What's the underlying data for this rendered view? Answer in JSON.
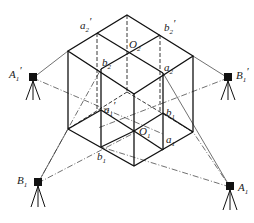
{
  "diagram": {
    "type": "survey-setup",
    "stroke_color": "#1a1a1a",
    "background": "#ffffff",
    "points": {
      "a2p": {
        "name": "a",
        "sub": "2",
        "prime": true
      },
      "b2p": {
        "name": "b",
        "sub": "2",
        "prime": true
      },
      "O2": {
        "name": "O",
        "sub": "2",
        "prime": false
      },
      "b2": {
        "name": "b",
        "sub": "2",
        "prime": false
      },
      "a2": {
        "name": "a",
        "sub": "2",
        "prime": false
      },
      "a1p": {
        "name": "a",
        "sub": "1",
        "prime": true
      },
      "b1p": {
        "name": "b",
        "sub": "1",
        "prime": false
      },
      "O1": {
        "name": "O",
        "sub": "1",
        "prime": false
      },
      "a1": {
        "name": "a",
        "sub": "1",
        "prime": false
      },
      "b1": {
        "name": "b",
        "sub": "1",
        "prime": false
      }
    },
    "stations": [
      {
        "id": "A1p",
        "name": "A",
        "sub": "1",
        "prime": true
      },
      {
        "id": "B1p",
        "name": "B",
        "sub": "1",
        "prime": true
      },
      {
        "id": "B1",
        "name": "B",
        "sub": "1",
        "prime": false
      },
      {
        "id": "A1",
        "name": "A",
        "sub": "1",
        "prime": false
      }
    ]
  }
}
